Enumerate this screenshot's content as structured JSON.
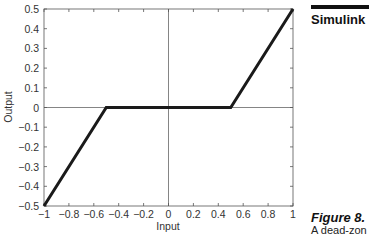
{
  "sidebar": {
    "section_title": "Simulink",
    "figure_label": "Figure 8.",
    "figure_caption": "A dead-zon"
  },
  "chart_data": {
    "type": "line",
    "title": "",
    "xlabel": "Input",
    "ylabel": "Output",
    "xlim": [
      -1,
      1
    ],
    "ylim": [
      -0.5,
      0.5
    ],
    "grid": false,
    "xticks": [
      -1,
      -0.8,
      -0.6,
      -0.4,
      -0.2,
      0,
      0.2,
      0.4,
      0.6,
      0.8,
      1
    ],
    "xtick_labels": [
      "−1",
      "−0.8",
      "−0.6",
      "−0.4",
      "−0.2",
      "0",
      "0.2",
      "0.4",
      "0.6",
      "0.8",
      "1"
    ],
    "yticks": [
      0.5,
      0.4,
      0.3,
      0.2,
      0.1,
      0,
      -0.1,
      -0.2,
      -0.3,
      -0.4,
      -0.5
    ],
    "ytick_labels": [
      "0.5",
      "0.4",
      "0.3",
      "0.2",
      "0.1",
      "0",
      "−0.1",
      "−0.2",
      "−0.3",
      "−0.4",
      "−0.5"
    ],
    "series": [
      {
        "name": "Dead zone output",
        "x": [
          -1,
          -0.5,
          0.5,
          1
        ],
        "y": [
          -0.5,
          0,
          0,
          0.5
        ]
      }
    ],
    "reference_lines": {
      "x_zero": true,
      "y_zero": true
    }
  }
}
